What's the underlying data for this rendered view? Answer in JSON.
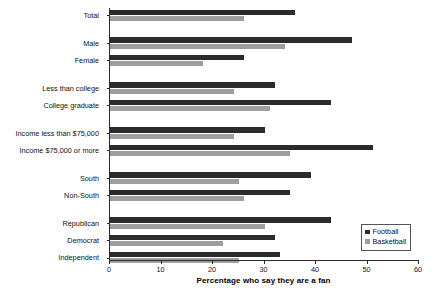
{
  "chart_data": {
    "type": "bar",
    "orientation": "horizontal",
    "title": "",
    "xlabel": "Percentage who say they are a fan",
    "ylabel": "",
    "xlim": [
      0,
      60
    ],
    "xticks": [
      0,
      10,
      20,
      30,
      40,
      50,
      60
    ],
    "xtick_labels": [
      "0",
      "10",
      "20",
      "30",
      "40",
      "50",
      "60"
    ],
    "grid": false,
    "legend_position": "lower-right",
    "categories": [
      "Total",
      "Male",
      "Female",
      "Less than college",
      "College graduate",
      "Income less than $75,000",
      "Income $75,000 or more",
      "South",
      "Non-South",
      "Republican",
      "Democrat",
      "Independent"
    ],
    "group_breaks_after": [
      "Total",
      "Female",
      "College graduate",
      "Income $75,000 or more",
      "Non-South"
    ],
    "series": [
      {
        "name": "Football",
        "color": "#2b2b2b",
        "values": [
          36,
          47,
          26,
          32,
          43,
          30,
          51,
          39,
          35,
          43,
          32,
          33
        ]
      },
      {
        "name": "Basketball",
        "color": "#9e9e9e",
        "values": [
          26,
          34,
          18,
          24,
          31,
          24,
          35,
          25,
          26,
          30,
          22,
          25
        ]
      }
    ]
  },
  "legend": {
    "items": [
      {
        "label": "Football",
        "color": "#2b2b2b"
      },
      {
        "label": "Basketball",
        "color": "#9e9e9e"
      }
    ]
  },
  "axis": {
    "x_title": "Percentage who say they are a fan"
  },
  "colors": {
    "football": "#2b2b2b",
    "basketball": "#9e9e9e",
    "axis": "#2b2b2b",
    "background": "#ffffff"
  }
}
